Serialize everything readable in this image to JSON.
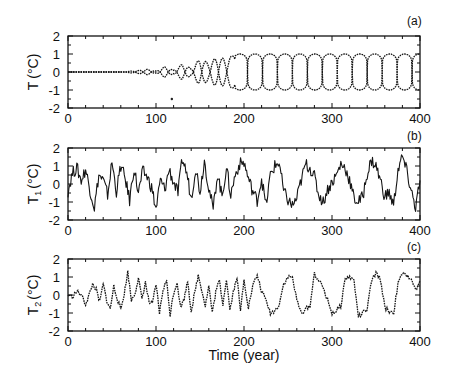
{
  "chart_data": [
    {
      "type": "line",
      "panel_label": "(a)",
      "ylabel": "T (°C)",
      "ylabel_main": "T",
      "ylabel_sub": "",
      "ylabel_unit": "(°C)",
      "xlabel": "",
      "xlim": [
        0,
        400
      ],
      "ylim": [
        -2,
        2
      ],
      "xticks": [
        0,
        100,
        200,
        300,
        400
      ],
      "yticks": [
        2,
        1,
        0,
        -1,
        -2
      ],
      "grid": false,
      "description": "Envelope of oscillation: near-zero until ~70 yr, growing lobes ~90-190 yr, then saturated square-wave-like lobes of amplitude ~±1 from ~190 to 400 yr",
      "series": [
        {
          "name": "upper envelope",
          "x": [
            0,
            60,
            80,
            90,
            100,
            110,
            120,
            130,
            140,
            150,
            160,
            170,
            180,
            190,
            200,
            400
          ],
          "y": [
            0,
            0,
            0.08,
            0.15,
            0.05,
            0.3,
            0.1,
            0.45,
            0.2,
            0.75,
            0.5,
            0.85,
            0.7,
            1.0,
            1.0,
            1.0
          ]
        },
        {
          "name": "lower envelope",
          "x": [
            0,
            60,
            80,
            90,
            100,
            110,
            120,
            130,
            140,
            150,
            160,
            170,
            180,
            190,
            200,
            400
          ],
          "y": [
            0,
            0,
            -0.08,
            -0.15,
            -0.05,
            -0.3,
            -0.1,
            -0.45,
            -0.2,
            -0.75,
            -0.5,
            -0.85,
            -0.7,
            -1.0,
            -1.0,
            -1.0
          ]
        }
      ],
      "annotations": [
        {
          "x": 118,
          "y": -1.5,
          "text": "stray mark"
        }
      ]
    },
    {
      "type": "line",
      "panel_label": "(b)",
      "ylabel": "T1 (°C)",
      "ylabel_main": "T",
      "ylabel_sub": "1",
      "ylabel_unit": "(°C)",
      "xlabel": "",
      "xlim": [
        0,
        400
      ],
      "ylim": [
        -2,
        2
      ],
      "xticks": [
        0,
        100,
        200,
        300,
        400
      ],
      "yticks": [
        2,
        1,
        0,
        -1,
        -2
      ],
      "grid": false,
      "description": "Noisy high-frequency fluctuations roughly within ±1.5, with slower multi-decadal swings after 200 yr",
      "series": [
        {
          "name": "T1",
          "x": [
            0,
            5,
            10,
            15,
            20,
            25,
            30,
            35,
            40,
            45,
            50,
            55,
            60,
            65,
            70,
            75,
            80,
            85,
            90,
            95,
            100,
            105,
            110,
            115,
            120,
            125,
            130,
            135,
            140,
            145,
            150,
            155,
            160,
            165,
            170,
            175,
            180,
            185,
            190,
            195,
            200,
            205,
            210,
            215,
            220,
            225,
            230,
            235,
            240,
            245,
            250,
            255,
            260,
            265,
            270,
            275,
            280,
            285,
            290,
            295,
            300,
            305,
            310,
            315,
            320,
            325,
            330,
            335,
            340,
            345,
            350,
            355,
            360,
            365,
            370,
            375,
            380,
            385,
            390,
            395,
            400
          ],
          "y": [
            -0.4,
            0.6,
            0.9,
            0.2,
            0.8,
            -0.3,
            -1.3,
            0.5,
            0.2,
            -0.6,
            1.2,
            -0.4,
            1.0,
            0.3,
            -0.9,
            0.9,
            -0.5,
            0.7,
            0.4,
            -0.2,
            -1.4,
            0.2,
            -0.3,
            0.8,
            0.1,
            -0.5,
            1.4,
            0.6,
            -0.8,
            0.9,
            -0.4,
            1.3,
            -0.2,
            -1.4,
            0.6,
            -0.7,
            0.9,
            -0.6,
            0.5,
            1.1,
            1.2,
            0.3,
            -0.4,
            -0.9,
            0.3,
            -1.2,
            0.5,
            1.0,
            1.2,
            -0.4,
            -0.9,
            -1.2,
            -0.8,
            0.2,
            1.1,
            0.9,
            0.4,
            -0.6,
            -1.0,
            -0.3,
            0.1,
            0.5,
            1.1,
            0.9,
            0.2,
            -0.8,
            -1.0,
            -0.7,
            0.6,
            1.3,
            1.0,
            0.2,
            -0.7,
            -0.5,
            -1.2,
            0.8,
            1.5,
            0.7,
            -0.4,
            -1.3,
            0.2
          ]
        }
      ]
    },
    {
      "type": "line",
      "panel_label": "(c)",
      "ylabel": "T2 (°C)",
      "ylabel_main": "T",
      "ylabel_sub": "2",
      "ylabel_unit": "(°C)",
      "xlabel": "Time (year)",
      "xlim": [
        0,
        400
      ],
      "ylim": [
        -2,
        2
      ],
      "xticks": [
        0,
        100,
        200,
        300,
        400
      ],
      "yticks": [
        2,
        1,
        0,
        -1,
        -2
      ],
      "grid": false,
      "description": "Quasi-periodic ~10-15 yr oscillations (±1) until ~210 yr, then slower square-wave-like switching with ~35-yr period between about +1 and -1",
      "series": [
        {
          "name": "T2",
          "x": [
            0,
            5,
            10,
            15,
            20,
            24,
            28,
            32,
            36,
            40,
            44,
            48,
            52,
            56,
            60,
            64,
            68,
            72,
            76,
            80,
            84,
            88,
            92,
            96,
            100,
            104,
            108,
            112,
            116,
            120,
            124,
            128,
            132,
            136,
            140,
            144,
            148,
            152,
            156,
            160,
            164,
            168,
            172,
            176,
            180,
            184,
            188,
            192,
            196,
            200,
            205,
            210,
            215,
            220,
            225,
            230,
            235,
            240,
            245,
            250,
            255,
            260,
            265,
            270,
            275,
            280,
            285,
            290,
            295,
            300,
            305,
            310,
            315,
            320,
            325,
            330,
            335,
            340,
            345,
            350,
            355,
            360,
            365,
            370,
            375,
            380,
            385,
            390,
            395,
            400
          ],
          "y": [
            0.0,
            -0.1,
            0.2,
            0.0,
            -0.5,
            0.0,
            0.6,
            0.3,
            -0.4,
            0.6,
            -0.3,
            -0.8,
            0.5,
            -0.2,
            -0.8,
            0.1,
            1.3,
            -0.3,
            0.1,
            0.9,
            -0.2,
            0.7,
            -0.4,
            -0.5,
            0.6,
            -1.0,
            0.3,
            0.8,
            -1.1,
            0.1,
            0.7,
            -0.7,
            -0.2,
            0.8,
            -0.9,
            0.1,
            1.1,
            0.3,
            -0.6,
            0.5,
            -1.0,
            0.2,
            0.8,
            -0.5,
            0.9,
            -0.8,
            0.2,
            1.0,
            -0.9,
            0.9,
            -0.7,
            0.5,
            1.1,
            0.2,
            -0.3,
            -1.0,
            -0.9,
            -0.5,
            0.6,
            1.0,
            1.0,
            -0.3,
            -1.0,
            -0.8,
            -0.6,
            1.2,
            0.8,
            0.4,
            -0.3,
            -1.0,
            -0.9,
            -0.6,
            0.9,
            1.0,
            0.8,
            -1.2,
            -1.0,
            -0.8,
            0.8,
            1.2,
            0.9,
            -0.7,
            -0.9,
            -1.0,
            0.6,
            1.2,
            1.0,
            1.0,
            0.2,
            0.8
          ]
        }
      ]
    }
  ],
  "figure": {
    "xlabel": "Time (year)"
  }
}
